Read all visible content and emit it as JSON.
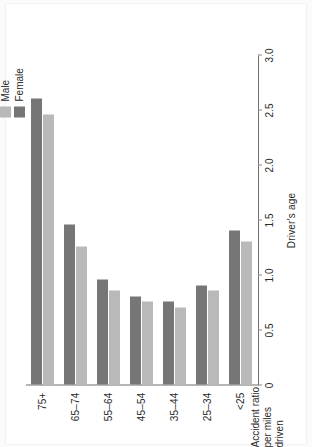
{
  "chart_data": {
    "type": "bar",
    "orientation": "horizontal",
    "title": "",
    "xlabel": "Driver's age",
    "ylabel": "Accident ratio per miles driven",
    "ylabel_lines": [
      "Accident ratio",
      "per miles",
      "driven"
    ],
    "categories": [
      "<25",
      "25–34",
      "35–44",
      "45–54",
      "55–64",
      "65–74",
      "75+"
    ],
    "series": [
      {
        "name": "Male",
        "color": "#b9b9b9",
        "values": [
          1.3,
          0.85,
          0.7,
          0.75,
          0.85,
          1.25,
          2.45
        ]
      },
      {
        "name": "Female",
        "color": "#767676",
        "values": [
          1.4,
          0.9,
          0.75,
          0.8,
          0.95,
          1.45,
          2.6
        ]
      }
    ],
    "value_axis": {
      "min": 0,
      "max": 3.0,
      "ticks": [
        0,
        0.5,
        1.0,
        1.5,
        2.0,
        2.5,
        3.0
      ],
      "tick_labels": [
        "0",
        "0.5",
        "1.0",
        "1.5",
        "2.0",
        "2.5",
        "3.0"
      ]
    },
    "grid": false,
    "legend_position": "top-right",
    "legend": [
      "Male",
      "Female"
    ]
  },
  "legend": {
    "items": [
      {
        "label": "Male",
        "color": "#b9b9b9"
      },
      {
        "label": "Female",
        "color": "#767676"
      }
    ]
  },
  "axes": {
    "category_axis_title": "Driver's age",
    "value_axis_title_lines": [
      "Accident ratio",
      "per miles",
      "driven"
    ]
  }
}
